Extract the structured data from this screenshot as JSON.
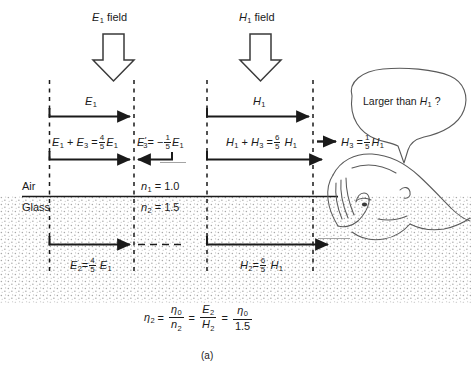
{
  "figure": {
    "caption": "(a)",
    "media_labels": {
      "top": "Air",
      "bottom": "Glass"
    },
    "indices": {
      "n1": "= 1.0",
      "n2": "= 1.5",
      "n1_sym": "n",
      "n1_sub": "1",
      "n2_sym": "n",
      "n2_sub": "2"
    },
    "source_labels": {
      "left": "field",
      "right": "field"
    },
    "speech_bubble": {
      "text_before": "Larger than",
      "symbol": "H",
      "symbol_sub": "1",
      "text_after": "?"
    }
  },
  "left_column": {
    "header_sym": "E",
    "header_sub": "1",
    "incident_label_sym": "E",
    "incident_label_sub": "1",
    "sum_label": {
      "t1_sym": "E",
      "t1_sub": "1",
      "plus": "+",
      "t2_sym": "E",
      "t2_sub": "3",
      "eq": "=",
      "frac_num": "4",
      "frac_den": "5",
      "t3_sym": "E",
      "t3_sub": "1"
    },
    "reflected_label": {
      "sym": "E",
      "prime": "'",
      "sub": "3",
      "eq": "=",
      "minus": "−",
      "frac_num": "1",
      "frac_den": "5",
      "t_sym": "E",
      "t_sub": "1"
    },
    "transmitted_label": {
      "sym": "E",
      "sub": "2",
      "eq": "=",
      "frac_num": "4",
      "frac_den": "5",
      "t_sym": "E",
      "t_sub": "1"
    }
  },
  "right_column": {
    "header_sym": "H",
    "header_sub": "1",
    "incident_label_sym": "H",
    "incident_label_sub": "1",
    "sum_label": {
      "t1_sym": "H",
      "t1_sub": "1",
      "plus": "+",
      "t2_sym": "H",
      "t2_sub": "3",
      "eq": "=",
      "frac_num": "6",
      "frac_den": "5",
      "t3_sym": "H",
      "t3_sub": "1"
    },
    "reflected_label": {
      "sym": "H",
      "sub": "3",
      "eq": "=",
      "frac_num": "1",
      "frac_den": "5",
      "t_sym": "H",
      "t_sub": "1"
    },
    "transmitted_label": {
      "sym": "H",
      "sub": "2",
      "eq": "=",
      "frac_num": "6",
      "frac_den": "5",
      "t_sym": "H",
      "t_sub": "1"
    }
  },
  "impedance_equation": {
    "lhs_sym": "η",
    "lhs_sub": "2",
    "eq1": "=",
    "f1_num_sym": "η",
    "f1_num_sub": "0",
    "f1_den_sym": "n",
    "f1_den_sub": "2",
    "eq2": "=",
    "f2_num_sym": "E",
    "f2_num_sub": "2",
    "f2_den_sym": "H",
    "f2_den_sub": "2",
    "eq3": "=",
    "f3_num_sym": "η",
    "f3_num_sub": "0",
    "f3_den": "1.5"
  },
  "colors": {
    "ink": "#1a1a1a",
    "stipple": "#9a9a9a",
    "bubble_stroke": "#555555",
    "background": "#ffffff"
  }
}
